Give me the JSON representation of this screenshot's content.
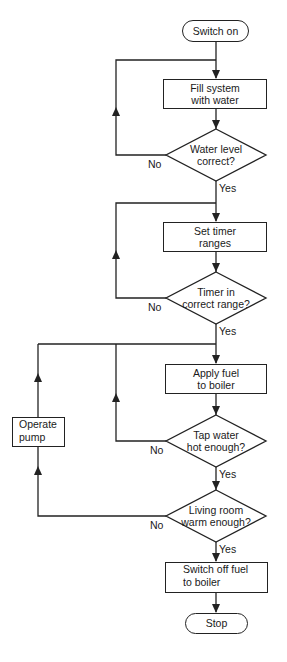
{
  "diagram": {
    "type": "flowchart",
    "nodes": {
      "start": {
        "label": "Switch on",
        "shape": "terminator"
      },
      "fill": {
        "label_line1": "Fill system",
        "label_line2": "with water",
        "shape": "process"
      },
      "water_level": {
        "label_line1": "Water level",
        "label_line2": "correct?",
        "shape": "decision"
      },
      "set_timer": {
        "label_line1": "Set timer",
        "label_line2": "ranges",
        "shape": "process"
      },
      "timer_range": {
        "label_line1": "Timer in",
        "label_line2": "correct range?",
        "shape": "decision"
      },
      "apply_fuel": {
        "label_line1": "Apply fuel",
        "label_line2": "to boiler",
        "shape": "process"
      },
      "tap_water": {
        "label_line1": "Tap water",
        "label_line2": "hot enough?",
        "shape": "decision"
      },
      "operate_pump": {
        "label_line1": "Operate",
        "label_line2": "pump",
        "shape": "process"
      },
      "living_room": {
        "label_line1": "Living room",
        "label_line2": "warm enough?",
        "shape": "decision"
      },
      "switch_off": {
        "label_line1": "Switch off fuel",
        "label_line2": "to boiler",
        "shape": "process"
      },
      "stop": {
        "label": "Stop",
        "shape": "terminator"
      }
    },
    "edge_labels": {
      "yes": "Yes",
      "no": "No"
    },
    "edges": [
      {
        "from": "start",
        "to": "fill"
      },
      {
        "from": "fill",
        "to": "water_level"
      },
      {
        "from": "water_level",
        "to": "fill",
        "label": "No"
      },
      {
        "from": "water_level",
        "to": "set_timer",
        "label": "Yes"
      },
      {
        "from": "set_timer",
        "to": "timer_range"
      },
      {
        "from": "timer_range",
        "to": "set_timer",
        "label": "No"
      },
      {
        "from": "timer_range",
        "to": "apply_fuel",
        "label": "Yes"
      },
      {
        "from": "apply_fuel",
        "to": "tap_water"
      },
      {
        "from": "tap_water",
        "to": "apply_fuel",
        "label": "No"
      },
      {
        "from": "tap_water",
        "to": "living_room",
        "label": "Yes"
      },
      {
        "from": "living_room",
        "to": "operate_pump",
        "label": "No"
      },
      {
        "from": "operate_pump",
        "to": "apply_fuel"
      },
      {
        "from": "living_room",
        "to": "switch_off",
        "label": "Yes"
      },
      {
        "from": "switch_off",
        "to": "stop"
      }
    ],
    "colors": {
      "stroke": "#222222",
      "background": "#ffffff",
      "text": "#1a1a1a"
    }
  }
}
